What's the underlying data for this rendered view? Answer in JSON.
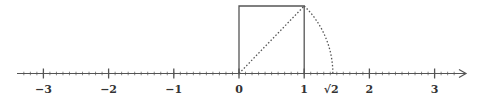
{
  "diagram": {
    "type": "number-line-construction",
    "axis": {
      "min_label": -3,
      "max_label": 3,
      "minor_ticks_per_unit": 10,
      "arrow": "right"
    },
    "tick_labels": [
      {
        "value": -3,
        "text": "−3"
      },
      {
        "value": -2,
        "text": "−2"
      },
      {
        "value": -1,
        "text": "−1"
      },
      {
        "value": 0,
        "text": "0"
      },
      {
        "value": 1,
        "text": "1"
      },
      {
        "value": 1.41421,
        "text": "√2"
      },
      {
        "value": 2,
        "text": "2"
      },
      {
        "value": 3,
        "text": "3"
      }
    ],
    "shapes": {
      "unit_square": {
        "from": 0,
        "to": 1,
        "style": "solid"
      },
      "diagonal": {
        "from": [
          0,
          0
        ],
        "to": [
          1,
          1
        ],
        "style": "dotted"
      },
      "arc": {
        "center": 0,
        "radius": "√2",
        "from_point": [
          1,
          1
        ],
        "to_point": [
          1.41421,
          0
        ],
        "style": "dotted"
      }
    },
    "colors": {
      "stroke": "#555555",
      "text": "#333333"
    }
  }
}
